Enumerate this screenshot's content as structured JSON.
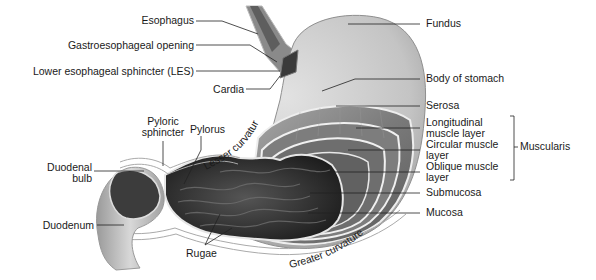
{
  "diagram": {
    "labels_left": {
      "esophagus": "Esophagus",
      "gastroesophageal_opening": "Gastroesophageal opening",
      "les": "Lower esophageal sphincter (LES)",
      "cardia": "Cardia",
      "pyloric_sphincter_line1": "Pyloric",
      "pyloric_sphincter_line2": "sphincter",
      "pylorus": "Pylorus",
      "duodenal_bulb_line1": "Duodenal",
      "duodenal_bulb_line2": "bulb",
      "duodenum": "Duodenum",
      "rugae": "Rugae"
    },
    "labels_right": {
      "fundus": "Fundus",
      "body_of_stomach": "Body of stomach",
      "serosa": "Serosa",
      "longitudinal_line1": "Longitudinal",
      "longitudinal_line2": "muscle layer",
      "circular_line1": "Circular muscle",
      "circular_line2": "layer",
      "oblique_line1": "Oblique muscle",
      "oblique_line2": "layer",
      "submucosa": "Submucosa",
      "mucosa": "Mucosa",
      "muscularis": "Muscularis"
    },
    "curvatures": {
      "lesser": "Lesser curvature",
      "greater": "Greater curvature"
    },
    "colors": {
      "outer_wall": "#c9c9c9",
      "muscle": "#8a8a8a",
      "lumen": "#2e2e2e",
      "leader_line": "#222222",
      "text": "#1a1a1a"
    }
  }
}
